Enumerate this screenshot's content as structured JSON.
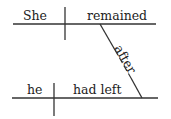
{
  "diagram": {
    "type": "sentence-diagram",
    "main_clause": {
      "subject": "She",
      "predicate": "remained"
    },
    "connector": "after",
    "subordinate_clause": {
      "subject": "he",
      "predicate": "had left"
    },
    "line_color": "#333333",
    "text_color": "#222222"
  }
}
